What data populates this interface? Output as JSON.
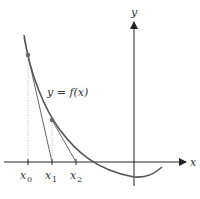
{
  "diagram": {
    "axes": {
      "x_label": "x",
      "y_label": "y"
    },
    "curve": {
      "label": "y = f(x)",
      "color": "#555555"
    },
    "points": [
      {
        "name": "x0",
        "label_main": "x",
        "label_sub": "0"
      },
      {
        "name": "x1",
        "label_main": "x",
        "label_sub": "1"
      },
      {
        "name": "x2",
        "label_main": "x",
        "label_sub": "2"
      }
    ],
    "colors": {
      "axis": "#222222",
      "tangent": "#666666",
      "guide": "#aaaaaa",
      "point": "#666666"
    }
  }
}
